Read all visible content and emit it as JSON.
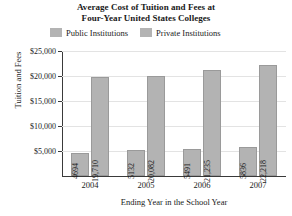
{
  "chart_data": {
    "type": "bar",
    "title": "Average Cost of Tuition and Fees at Four-Year United States Colleges",
    "title_lines": [
      "Average Cost of Tuition and Fees at",
      "Four-Year United States Colleges"
    ],
    "xlabel": "Ending Year in the School Year",
    "ylabel": "Tuition and Fees",
    "categories": [
      "2004",
      "2005",
      "2006",
      "2007"
    ],
    "series": [
      {
        "name": "Public Institutions",
        "color": "#b3b3b3",
        "values": [
          4694,
          5132,
          5491,
          5836
        ],
        "labels": [
          "4694",
          "5132",
          "5491",
          "5836"
        ]
      },
      {
        "name": "Private Institutions",
        "color": "#b3b3b3",
        "values": [
          19710,
          20082,
          21235,
          22218
        ],
        "labels": [
          "19,710",
          "20,082",
          "21,235",
          "22,218"
        ]
      }
    ],
    "ylim": [
      0,
      25000
    ],
    "yticks": [
      5000,
      10000,
      15000,
      20000,
      25000
    ],
    "ytick_labels": [
      "$5,000",
      "$10,000",
      "$15,000",
      "$20,000",
      "$25,000"
    ],
    "grid": true,
    "legend_position": "top"
  },
  "style": {
    "bar_fill": "#b3b3b3",
    "bar_stroke": "#9a9a9a",
    "axis_color": "#3a3a3a",
    "grid_color": "#e3e3e3",
    "background": "#ffffff",
    "text_color": "#1a1a1a"
  }
}
